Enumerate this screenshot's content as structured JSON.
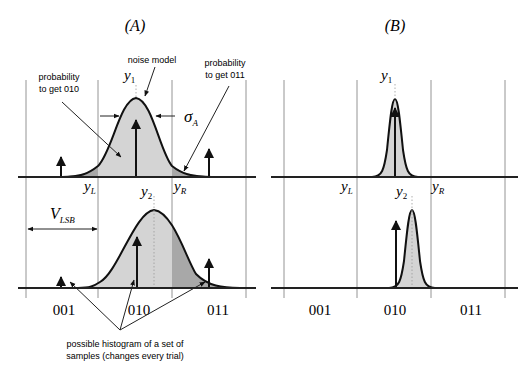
{
  "panels": [
    {
      "id": "A",
      "title": "(A)",
      "labels": {
        "y1": "y",
        "y1_sub": "1",
        "y2": "y",
        "y2_sub": "2",
        "yL": "y",
        "yL_sub": "L",
        "yR": "y",
        "yR_sub": "R",
        "sigma": "σ",
        "sigma_sub": "A",
        "vlsb": "V",
        "vlsb_sub": "LSB"
      },
      "annotations": {
        "noise_model": "noise model",
        "prob_010_line1": "probability",
        "prob_010_line2": "to get 010",
        "prob_011_line1": "probability",
        "prob_011_line2": "to get 011",
        "histogram_line1": "possible histogram of a set of",
        "histogram_line2": "samples (changes every trial)"
      },
      "codes": [
        "001",
        "010",
        "011"
      ]
    },
    {
      "id": "B",
      "title": "(B)",
      "labels": {
        "y1": "y",
        "y1_sub": "1",
        "y2": "y",
        "y2_sub": "2",
        "yL": "y",
        "yL_sub": "L",
        "yR": "y",
        "yR_sub": "R"
      },
      "codes": [
        "001",
        "010",
        "011"
      ]
    }
  ],
  "colors": {
    "fill_light": "#d4d4d4",
    "fill_dark": "#a8a8a8",
    "line": "#111111",
    "grid": "#7a7a7a"
  }
}
